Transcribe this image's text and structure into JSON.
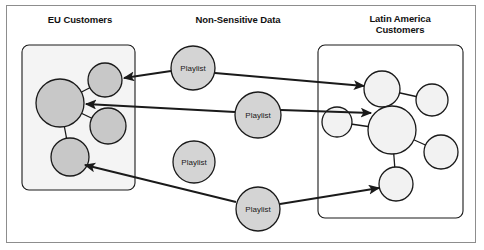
{
  "diagram": {
    "title_eu": "EU Customers",
    "title_center": "Non-Sensitive Data",
    "title_latam": "Latin America\nCustomers",
    "colors": {
      "eu_node_fill": "#c8c8c8",
      "playlist_fill": "#d4d4d4",
      "latam_node_fill": "#f2f2f2",
      "eu_box_fill": "#f4f4f4",
      "latam_box_fill": "#ffffff",
      "stroke": "#1a1a1a",
      "frame_stroke": "#8d8d8d"
    },
    "groups": [
      {
        "id": "eu-customers",
        "label": "EU Customers",
        "box": {
          "x": 22,
          "y": 45,
          "w": 113,
          "h": 145
        },
        "nodes": [
          {
            "id": "eu-n1",
            "label": "",
            "cx": 105,
            "cy": 80,
            "r": 17
          },
          {
            "id": "eu-n2",
            "label": "",
            "cx": 60,
            "cy": 103,
            "r": 24
          },
          {
            "id": "eu-n3",
            "label": "",
            "cx": 108,
            "cy": 126,
            "r": 18
          },
          {
            "id": "eu-n4",
            "label": "",
            "cx": 70,
            "cy": 157,
            "r": 19
          }
        ],
        "links": [
          {
            "from": "eu-n2",
            "to": "eu-n1"
          },
          {
            "from": "eu-n2",
            "to": "eu-n3"
          },
          {
            "from": "eu-n2",
            "to": "eu-n4"
          }
        ]
      },
      {
        "id": "latin-america-customers",
        "label": "Latin America Customers",
        "box": {
          "x": 318,
          "y": 45,
          "w": 145,
          "h": 173
        },
        "nodes": [
          {
            "id": "la-n1",
            "label": "",
            "cx": 382,
            "cy": 89,
            "r": 18
          },
          {
            "id": "la-n2",
            "label": "",
            "cx": 432,
            "cy": 100,
            "r": 16
          },
          {
            "id": "la-n3",
            "label": "",
            "cx": 337,
            "cy": 122,
            "r": 15
          },
          {
            "id": "la-n4",
            "label": "",
            "cx": 392,
            "cy": 130,
            "r": 24
          },
          {
            "id": "la-n5",
            "label": "",
            "cx": 441,
            "cy": 152,
            "r": 17
          },
          {
            "id": "la-n6",
            "label": "",
            "cx": 396,
            "cy": 184,
            "r": 17
          }
        ],
        "links": [
          {
            "from": "la-n1",
            "to": "la-n2"
          },
          {
            "from": "la-n1",
            "to": "la-n4"
          },
          {
            "from": "la-n4",
            "to": "la-n5"
          },
          {
            "from": "la-n4",
            "to": "la-n6"
          },
          {
            "from": "la-n3",
            "to": "la-n4"
          }
        ]
      }
    ],
    "playlists": [
      {
        "id": "pl-1",
        "label": "Playlist",
        "cx": 193,
        "cy": 68,
        "r": 22
      },
      {
        "id": "pl-2",
        "label": "Playlist",
        "cx": 258,
        "cy": 115,
        "r": 23
      },
      {
        "id": "pl-3",
        "label": "Playlist",
        "cx": 194,
        "cy": 162,
        "r": 21
      },
      {
        "id": "pl-4",
        "label": "Playlist",
        "cx": 258,
        "cy": 209,
        "r": 22
      }
    ],
    "arrows": [
      {
        "id": "arrow-pl1-eu",
        "from": "pl-1",
        "to": "eu-n1",
        "x1": 171,
        "y1": 71,
        "x2": 124,
        "y2": 78
      },
      {
        "id": "arrow-pl2-eu",
        "from": "pl-2",
        "to": "eu-n2",
        "x1": 235,
        "y1": 112,
        "x2": 86,
        "y2": 104
      },
      {
        "id": "arrow-pl4-eu",
        "from": "pl-4",
        "to": "eu-n4",
        "x1": 236,
        "y1": 202,
        "x2": 85,
        "y2": 165
      },
      {
        "id": "arrow-pl1-latam",
        "from": "pl-1",
        "to": "la-n1",
        "x1": 215,
        "y1": 73,
        "x2": 364,
        "y2": 86
      },
      {
        "id": "arrow-pl2-latam",
        "from": "pl-2",
        "to": "la-n4",
        "x1": 281,
        "y1": 110,
        "x2": 371,
        "y2": 113
      },
      {
        "id": "arrow-pl4-latam",
        "from": "pl-4",
        "to": "la-n6",
        "x1": 280,
        "y1": 204,
        "x2": 379,
        "y2": 188
      }
    ]
  }
}
